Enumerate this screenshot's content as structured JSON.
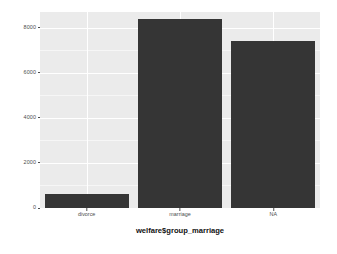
{
  "chart_data": {
    "type": "bar",
    "title": "",
    "subtitle": "",
    "xlabel": "welfare$group_marriage",
    "ylabel": "",
    "categories": [
      "divorce",
      "marriage",
      "NA"
    ],
    "values": [
      600,
      8400,
      7400
    ],
    "series": [
      {
        "name": "count",
        "values": [
          600,
          8400,
          7400
        ]
      }
    ],
    "ylim": [
      0,
      8700
    ],
    "y_ticks": [
      0,
      2000,
      4000,
      6000,
      8000
    ],
    "y_tick_labels": [
      "0",
      "2000",
      "4000",
      "6000",
      "8000"
    ],
    "x_tick_labels": [
      "divorce",
      "marriage",
      "NA"
    ],
    "grid": true,
    "grid_minor": true,
    "legend": false,
    "legend_position": "none",
    "bar_color": "#353535",
    "panel_background": "#ebebeb",
    "gridline_color": "#ffffff",
    "axis_text_color": "#4d4d4d",
    "plot_background": "#ffffff",
    "annotations": []
  },
  "axes": {
    "y_labels": [
      {
        "value": 8000,
        "text": "8000"
      },
      {
        "value": 6000,
        "text": "6000"
      },
      {
        "value": 4000,
        "text": "4000"
      },
      {
        "value": 2000,
        "text": "2000"
      },
      {
        "value": 0,
        "text": "0"
      }
    ],
    "x_labels": [
      {
        "text": "divorce"
      },
      {
        "text": "marriage"
      },
      {
        "text": "NA"
      }
    ],
    "x_title": "welfare$group_marriage"
  }
}
